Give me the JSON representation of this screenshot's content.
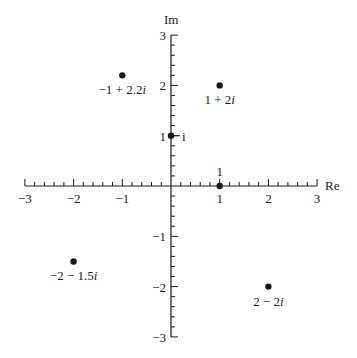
{
  "chart_data": {
    "type": "scatter",
    "title": "",
    "xlabel": "Re",
    "ylabel": "Im",
    "xlim": [
      -3,
      3
    ],
    "ylim": [
      -3,
      3
    ],
    "grid": false,
    "x_ticks": [
      -3,
      -2,
      -1,
      1,
      2,
      3
    ],
    "x_tick_labels": [
      "−3",
      "−2",
      "−1",
      "1",
      "2",
      "3"
    ],
    "y_ticks": [
      3,
      2,
      1,
      -1,
      -2,
      -3
    ],
    "y_tick_labels": [
      "3",
      "2",
      "1",
      "−1",
      "−2",
      "−3"
    ],
    "minor_ticks_per_unit": 5,
    "points": [
      {
        "re": -1,
        "im": 2.2,
        "label": "−1 + 2.2i"
      },
      {
        "re": 1,
        "im": 2,
        "label": "1 + 2i"
      },
      {
        "re": 0,
        "im": 1,
        "label": "i"
      },
      {
        "re": 1,
        "im": 0,
        "label": "1"
      },
      {
        "re": -2,
        "im": -1.5,
        "label": "−2 − 1.5i"
      },
      {
        "re": 2,
        "im": -2,
        "label": "2 − 2i"
      }
    ]
  },
  "colors": {
    "ink": "#1a1a1a",
    "background": "#ffffff"
  }
}
